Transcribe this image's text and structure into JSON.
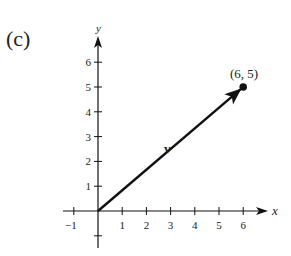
{
  "panel_label": "(c)",
  "axes": {
    "x_label": "x",
    "y_label": "y",
    "x_ticks": [
      {
        "value": -1,
        "label": "−1"
      },
      {
        "value": 1,
        "label": "1"
      },
      {
        "value": 2,
        "label": "2"
      },
      {
        "value": 3,
        "label": "3"
      },
      {
        "value": 4,
        "label": "4"
      },
      {
        "value": 5,
        "label": "5"
      },
      {
        "value": 6,
        "label": "6"
      }
    ],
    "y_ticks": [
      {
        "value": -1,
        "label": ""
      },
      {
        "value": 1,
        "label": "1"
      },
      {
        "value": 2,
        "label": "2"
      },
      {
        "value": 3,
        "label": "3"
      },
      {
        "value": 4,
        "label": "4"
      },
      {
        "value": 5,
        "label": "5"
      },
      {
        "value": 6,
        "label": "6"
      }
    ],
    "xlim": [
      -1.4,
      7.0
    ],
    "ylim": [
      -1.6,
      6.9
    ]
  },
  "vector": {
    "name": "v",
    "tail": [
      0,
      0
    ],
    "head": [
      6,
      5
    ]
  },
  "point": {
    "label": "(6, 5)",
    "x": 6,
    "y": 5
  },
  "colors": {
    "ink": "#111111",
    "text": "#222222",
    "background": "#ffffff"
  }
}
